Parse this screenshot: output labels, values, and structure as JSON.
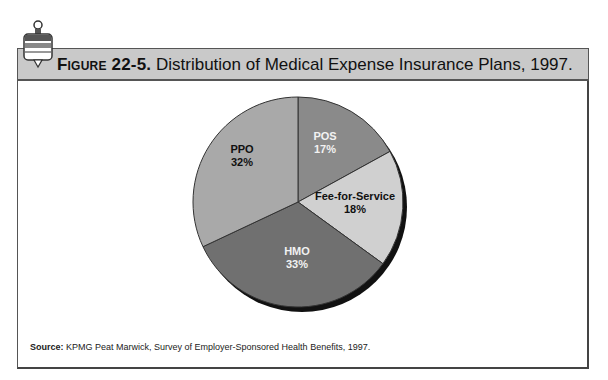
{
  "header": {
    "figure_label": "Figure 22-5.",
    "title": "Distribution of Medical Expense Insurance Plans, 1997."
  },
  "source": {
    "label": "Source:",
    "text": "KPMG Peat Marwick, Survey of Employer-Sponsored Health Benefits, 1997."
  },
  "chart_data": {
    "type": "pie",
    "title": "Distribution of Medical Expense Insurance Plans, 1997.",
    "start_angle_deg": 0,
    "direction": "clockwise",
    "slices": [
      {
        "label": "POS",
        "value": 17,
        "display": "17%",
        "color": "#8a8a8a",
        "text_color": "#f2f2f2"
      },
      {
        "label": "Fee-for-Service",
        "value": 18,
        "display": "18%",
        "color": "#d0d0d0",
        "text_color": "#111111"
      },
      {
        "label": "HMO",
        "value": 33,
        "display": "33%",
        "color": "#707070",
        "text_color": "#f2f2f2"
      },
      {
        "label": "PPO",
        "value": 32,
        "display": "32%",
        "color": "#a9a9a9",
        "text_color": "#111111"
      }
    ],
    "source": "KPMG Peat Marwick, Survey of Employer-Sponsored Health Benefits, 1997."
  }
}
